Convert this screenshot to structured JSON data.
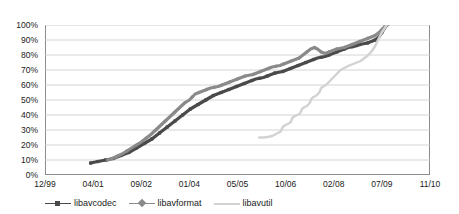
{
  "chart_data": {
    "type": "line",
    "title": "",
    "xlabel": "",
    "ylabel": "",
    "grid": true,
    "legend_position": "bottom",
    "xlim": [
      0,
      8
    ],
    "ylim": [
      0,
      100
    ],
    "y_ticks": [
      "0%",
      "10%",
      "20%",
      "30%",
      "40%",
      "50%",
      "60%",
      "70%",
      "80%",
      "90%",
      "100%"
    ],
    "y_tick_values": [
      0,
      10,
      20,
      30,
      40,
      50,
      60,
      70,
      80,
      90,
      100
    ],
    "x_ticks": [
      "12/99",
      "04/01",
      "09/02",
      "01/04",
      "05/05",
      "10/06",
      "02/08",
      "07/09",
      "11/10"
    ],
    "x_tick_values": [
      0,
      1,
      2,
      3,
      4,
      5,
      6,
      7,
      8
    ],
    "series": [
      {
        "name": "libavcodec",
        "color": "#4a4a4a",
        "marker": "square",
        "points": [
          [
            0.95,
            8
          ],
          [
            1.02,
            8.5
          ],
          [
            1.1,
            9
          ],
          [
            1.18,
            9.5
          ],
          [
            1.26,
            10
          ],
          [
            1.34,
            10.5
          ],
          [
            1.42,
            11
          ],
          [
            1.5,
            12
          ],
          [
            1.58,
            13
          ],
          [
            1.66,
            14
          ],
          [
            1.74,
            15
          ],
          [
            1.82,
            16.5
          ],
          [
            1.9,
            18
          ],
          [
            1.98,
            19.5
          ],
          [
            2.06,
            21
          ],
          [
            2.14,
            22.5
          ],
          [
            2.22,
            24
          ],
          [
            2.3,
            26
          ],
          [
            2.38,
            28
          ],
          [
            2.46,
            30
          ],
          [
            2.54,
            32
          ],
          [
            2.62,
            34
          ],
          [
            2.7,
            36
          ],
          [
            2.78,
            38
          ],
          [
            2.86,
            40
          ],
          [
            2.94,
            42
          ],
          [
            3.02,
            44
          ],
          [
            3.1,
            45.5
          ],
          [
            3.18,
            47
          ],
          [
            3.26,
            48.5
          ],
          [
            3.34,
            50
          ],
          [
            3.42,
            51.5
          ],
          [
            3.5,
            53
          ],
          [
            3.58,
            54
          ],
          [
            3.66,
            55
          ],
          [
            3.74,
            56
          ],
          [
            3.82,
            57
          ],
          [
            3.9,
            58
          ],
          [
            3.98,
            59
          ],
          [
            4.06,
            60
          ],
          [
            4.14,
            61
          ],
          [
            4.22,
            62
          ],
          [
            4.3,
            63
          ],
          [
            4.38,
            64
          ],
          [
            4.46,
            64.5
          ],
          [
            4.54,
            65
          ],
          [
            4.62,
            66
          ],
          [
            4.7,
            67
          ],
          [
            4.78,
            68
          ],
          [
            4.86,
            68.5
          ],
          [
            4.94,
            69
          ],
          [
            5.02,
            70
          ],
          [
            5.1,
            71
          ],
          [
            5.18,
            72
          ],
          [
            5.26,
            73
          ],
          [
            5.34,
            74
          ],
          [
            5.42,
            75
          ],
          [
            5.5,
            76
          ],
          [
            5.58,
            77
          ],
          [
            5.66,
            78
          ],
          [
            5.74,
            78.5
          ],
          [
            5.82,
            79
          ],
          [
            5.9,
            80
          ],
          [
            5.98,
            81
          ],
          [
            6.06,
            82
          ],
          [
            6.14,
            83
          ],
          [
            6.22,
            84
          ],
          [
            6.3,
            85
          ],
          [
            6.38,
            85.5
          ],
          [
            6.46,
            86
          ],
          [
            6.54,
            87
          ],
          [
            6.62,
            87.5
          ],
          [
            6.7,
            88
          ],
          [
            6.78,
            89
          ],
          [
            6.86,
            90
          ],
          [
            6.94,
            92
          ],
          [
            7.0,
            95
          ],
          [
            7.06,
            98
          ],
          [
            7.1,
            100
          ]
        ]
      },
      {
        "name": "libavformat",
        "color": "#8a8a8a",
        "marker": "diamond",
        "points": [
          [
            1.3,
            10
          ],
          [
            1.4,
            11
          ],
          [
            1.5,
            12.5
          ],
          [
            1.6,
            14
          ],
          [
            1.7,
            16
          ],
          [
            1.8,
            18
          ],
          [
            1.9,
            20
          ],
          [
            2.0,
            22
          ],
          [
            2.1,
            24.5
          ],
          [
            2.2,
            27
          ],
          [
            2.3,
            30
          ],
          [
            2.4,
            33
          ],
          [
            2.5,
            36
          ],
          [
            2.6,
            39
          ],
          [
            2.7,
            42
          ],
          [
            2.8,
            45
          ],
          [
            2.9,
            48
          ],
          [
            3.0,
            50
          ],
          [
            3.06,
            52
          ],
          [
            3.12,
            54
          ],
          [
            3.2,
            55
          ],
          [
            3.28,
            56
          ],
          [
            3.36,
            57
          ],
          [
            3.44,
            58
          ],
          [
            3.52,
            58.5
          ],
          [
            3.6,
            59
          ],
          [
            3.68,
            60
          ],
          [
            3.76,
            61
          ],
          [
            3.84,
            62
          ],
          [
            3.92,
            63
          ],
          [
            4.0,
            64
          ],
          [
            4.08,
            65
          ],
          [
            4.16,
            66
          ],
          [
            4.24,
            66.5
          ],
          [
            4.32,
            67
          ],
          [
            4.4,
            68
          ],
          [
            4.48,
            69
          ],
          [
            4.56,
            70
          ],
          [
            4.64,
            71
          ],
          [
            4.72,
            72
          ],
          [
            4.8,
            72.5
          ],
          [
            4.88,
            73
          ],
          [
            4.96,
            74
          ],
          [
            5.04,
            75
          ],
          [
            5.12,
            76
          ],
          [
            5.2,
            77
          ],
          [
            5.28,
            78
          ],
          [
            5.36,
            80
          ],
          [
            5.44,
            82
          ],
          [
            5.52,
            84
          ],
          [
            5.6,
            85
          ],
          [
            5.66,
            84
          ],
          [
            5.74,
            82
          ],
          [
            5.82,
            81
          ],
          [
            5.9,
            82
          ],
          [
            5.98,
            83
          ],
          [
            6.06,
            84
          ],
          [
            6.14,
            84.5
          ],
          [
            6.22,
            85
          ],
          [
            6.3,
            86
          ],
          [
            6.38,
            87
          ],
          [
            6.46,
            88
          ],
          [
            6.54,
            89
          ],
          [
            6.62,
            90
          ],
          [
            6.7,
            91
          ],
          [
            6.78,
            92
          ],
          [
            6.86,
            93
          ],
          [
            6.94,
            95
          ],
          [
            7.0,
            97
          ],
          [
            7.06,
            99
          ],
          [
            7.1,
            100
          ]
        ]
      },
      {
        "name": "libavutil",
        "color": "#d2d2d2",
        "marker": "none",
        "points": [
          [
            4.45,
            25
          ],
          [
            4.55,
            25
          ],
          [
            4.65,
            25.5
          ],
          [
            4.72,
            26
          ],
          [
            4.78,
            27
          ],
          [
            4.84,
            28
          ],
          [
            4.9,
            29
          ],
          [
            4.94,
            32
          ],
          [
            4.98,
            33
          ],
          [
            5.04,
            34
          ],
          [
            5.1,
            35
          ],
          [
            5.14,
            38
          ],
          [
            5.18,
            39
          ],
          [
            5.24,
            40
          ],
          [
            5.3,
            41
          ],
          [
            5.34,
            44
          ],
          [
            5.38,
            45
          ],
          [
            5.44,
            46
          ],
          [
            5.5,
            48
          ],
          [
            5.54,
            51
          ],
          [
            5.58,
            52
          ],
          [
            5.64,
            53
          ],
          [
            5.7,
            55
          ],
          [
            5.74,
            58
          ],
          [
            5.78,
            59
          ],
          [
            5.84,
            60
          ],
          [
            5.9,
            62
          ],
          [
            5.96,
            64
          ],
          [
            6.02,
            66
          ],
          [
            6.08,
            68
          ],
          [
            6.14,
            70
          ],
          [
            6.2,
            71
          ],
          [
            6.26,
            72
          ],
          [
            6.32,
            73
          ],
          [
            6.4,
            74
          ],
          [
            6.48,
            75
          ],
          [
            6.56,
            76
          ],
          [
            6.64,
            78
          ],
          [
            6.72,
            80
          ],
          [
            6.8,
            83
          ],
          [
            6.86,
            86
          ],
          [
            6.92,
            90
          ],
          [
            6.98,
            94
          ],
          [
            7.04,
            97
          ],
          [
            7.1,
            100
          ]
        ]
      }
    ]
  }
}
